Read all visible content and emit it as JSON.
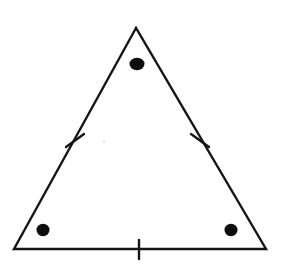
{
  "figure": {
    "kind": "geometry-diagram",
    "shape_name": "equilateral-triangle",
    "background_color": "#ffffff",
    "ink_color": "#151515",
    "dot_color": "#0d0d0d",
    "canvas": {
      "width": 284,
      "height": 274
    },
    "labels": [],
    "caption": ""
  },
  "chart_data": {
    "type": "diagram",
    "title": "",
    "xlabel": "",
    "ylabel": "",
    "vertices": [
      {
        "name": "apex",
        "x": 136,
        "y": 28
      },
      {
        "name": "bottom-left",
        "x": 14,
        "y": 249
      },
      {
        "name": "bottom-right",
        "x": 266,
        "y": 249
      }
    ],
    "sides": [
      {
        "name": "left-side",
        "from": "apex",
        "to": "bottom-left",
        "tick_count": 1
      },
      {
        "name": "right-side",
        "from": "apex",
        "to": "bottom-right",
        "tick_count": 1
      },
      {
        "name": "base",
        "from": "bottom-left",
        "to": "bottom-right",
        "tick_count": 1
      }
    ],
    "tick_marks": [
      {
        "name": "left-side-tick",
        "x1": 66,
        "y1": 147,
        "x2": 84,
        "y2": 134
      },
      {
        "name": "right-side-tick",
        "x1": 191,
        "y1": 134,
        "x2": 209,
        "y2": 147
      },
      {
        "name": "base-tick",
        "x1": 139,
        "y1": 240,
        "x2": 139,
        "y2": 259
      }
    ],
    "dots": [
      {
        "name": "apex-dot",
        "cx": 137,
        "cy": 64,
        "rx": 7.5,
        "ry": 6.2
      },
      {
        "name": "bottom-left-dot",
        "cx": 43,
        "cy": 230,
        "rx": 6.5,
        "ry": 6.2
      },
      {
        "name": "bottom-right-dot",
        "cx": 231,
        "cy": 230,
        "rx": 6.5,
        "ry": 6.2
      }
    ]
  }
}
